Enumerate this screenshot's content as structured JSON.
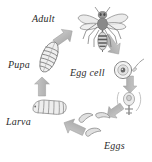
{
  "diagram": {
    "type": "cycle-diagram",
    "background_color": "#ffffff",
    "arrow_color": "#b5b5b5",
    "art_color": "#808080",
    "text_color": "#2b2b2b",
    "stages": [
      {
        "id": "adult",
        "label": "Adult",
        "icon": "wasp-icon",
        "description": "Adult wasp with wings, antennae and striped abdomen"
      },
      {
        "id": "egg-cell",
        "label": "Egg cell",
        "icon": "egg-cell-icon",
        "description": "Circular nest cell containing a single egg with nucleus"
      },
      {
        "id": "eggs",
        "label": "Eggs",
        "icon": "eggs-icon",
        "description": "Three curved comma-shaped eggs"
      },
      {
        "id": "larva",
        "label": "Larva",
        "icon": "larva-icon",
        "description": "Segmented grub-like larva"
      },
      {
        "id": "pupa",
        "label": "Pupa",
        "icon": "pupa-icon",
        "description": "Oval ribbed cocoon"
      }
    ],
    "connectors": [
      {
        "id": "pupa-to-adult",
        "from": "pupa",
        "to": "adult",
        "direction": "up-right"
      },
      {
        "id": "adult-to-eggcell",
        "from": "adult",
        "to": "egg-cell",
        "direction": "down-right"
      },
      {
        "id": "eggcell-to-ovipos",
        "from": "egg-cell",
        "to": "eggs",
        "direction": "down"
      },
      {
        "id": "ovipos-to-eggs",
        "from": "eggs",
        "to": "eggs",
        "direction": "down-left"
      },
      {
        "id": "eggs-to-larva",
        "from": "eggs",
        "to": "larva",
        "direction": "up-left"
      },
      {
        "id": "larva-to-pupa",
        "from": "larva",
        "to": "pupa",
        "direction": "up"
      }
    ]
  }
}
